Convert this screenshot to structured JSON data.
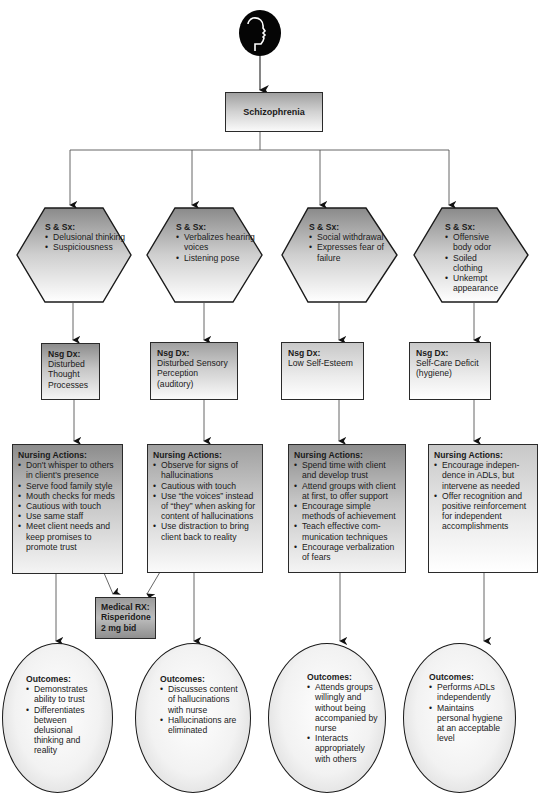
{
  "header": {
    "icon": "human-head-profile-icon",
    "root_label": "Schizophrenia"
  },
  "columns": [
    {
      "signs": {
        "title": "S & Sx:",
        "items": [
          "Delusional thinking",
          "Suspiciousness"
        ]
      },
      "diagnosis": {
        "title": "Nsg Dx:",
        "text": "Disturbed Thought Processes"
      },
      "actions": {
        "title": "Nursing Actions:",
        "items": [
          "Don't whisper to others in client's presence",
          "Serve food family style",
          "Mouth checks for meds",
          "Cautious with touch",
          "Use same staff",
          "Meet client needs and keep promises to promote trust"
        ]
      },
      "outcomes": {
        "title": "Outcomes:",
        "items": [
          "Demonstrates ability to trust",
          "Differentiates between delusional thinking and reality"
        ]
      }
    },
    {
      "signs": {
        "title": "S & Sx:",
        "items": [
          "Verbalizes hearing voices",
          "Listening pose"
        ]
      },
      "diagnosis": {
        "title": "Nsg Dx:",
        "text": "Disturbed Sensory Perception (auditory)"
      },
      "actions": {
        "title": "Nursing Actions:",
        "items": [
          "Observe for signs of hallucinations",
          "Cautious with touch",
          "Use “the voices” instead of “they” when asking for content of hallucinations",
          "Use distraction to bring client back to reality"
        ]
      },
      "outcomes": {
        "title": "Outcomes:",
        "items": [
          "Discusses content of hallucinations with nurse",
          "Hallucinations are eliminated"
        ]
      }
    },
    {
      "signs": {
        "title": "S & Sx:",
        "items": [
          "Social withdrawal",
          "Expresses fear of failure"
        ]
      },
      "diagnosis": {
        "title": "Nsg Dx:",
        "text": "Low Self-Esteem"
      },
      "actions": {
        "title": "Nursing Actions:",
        "items": [
          "Spend time with client and develop trust",
          "Attend groups with client at first, to offer support",
          "Encourage simple methods of achievement",
          "Teach effective com-munication techniques",
          "Encourage verbalization of fears"
        ]
      },
      "outcomes": {
        "title": "Outcomes:",
        "items": [
          "Attends groups willingly and without being accompanied by nurse",
          "Interacts appropriately with others"
        ]
      }
    },
    {
      "signs": {
        "title": "S & Sx:",
        "items": [
          "Offensive body odor",
          "Soiled clothing",
          "Unkempt appearance"
        ]
      },
      "diagnosis": {
        "title": "Nsg Dx:",
        "text": "Self-Care Deficit (hygiene)"
      },
      "actions": {
        "title": "Nursing Actions:",
        "items": [
          "Encourage indepen-dence in ADLs, but intervene as needed",
          "Offer recognition and positive reinforcement for independent accomplishments"
        ]
      },
      "outcomes": {
        "title": "Outcomes:",
        "items": [
          "Performs ADLs independently",
          "Maintains personal hygiene at an acceptable level"
        ]
      }
    }
  ],
  "medical_rx": {
    "title": "Medical RX:",
    "drug": "Risperidone",
    "dose": "2 mg bid"
  }
}
